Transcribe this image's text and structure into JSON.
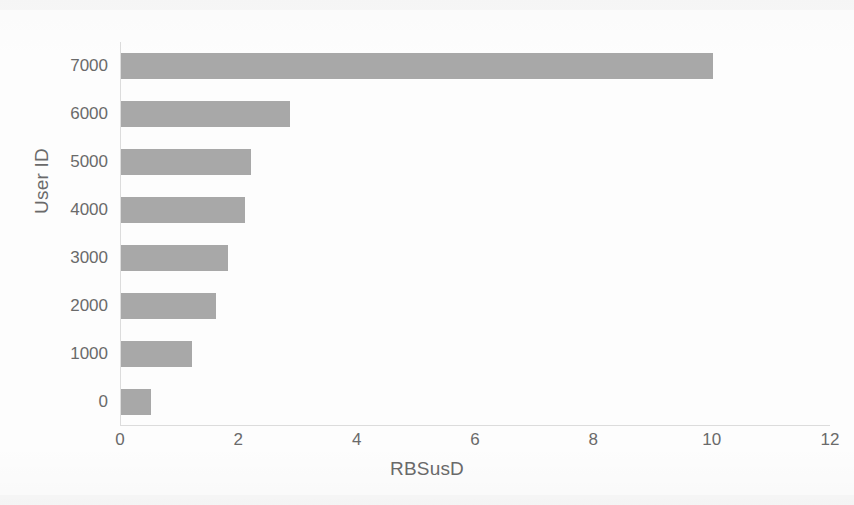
{
  "chart_data": {
    "type": "bar",
    "orientation": "horizontal",
    "title": "",
    "xlabel": "RBSusD",
    "ylabel": "User ID",
    "categories": [
      "7000",
      "6000",
      "5000",
      "4000",
      "3000",
      "2000",
      "1000",
      "0"
    ],
    "values": [
      10.0,
      2.85,
      2.2,
      2.1,
      1.8,
      1.6,
      1.2,
      0.5
    ],
    "xlim": [
      0,
      12
    ],
    "xticks": [
      "0",
      "2",
      "4",
      "6",
      "8",
      "10",
      "12"
    ],
    "xtick_values": [
      0,
      2,
      4,
      6,
      8,
      10,
      12
    ],
    "yticks": [
      "7000",
      "6000",
      "5000",
      "4000",
      "3000",
      "2000",
      "1000",
      "0"
    ],
    "grid": false,
    "legend": false,
    "bar_color": "#a8a8a8",
    "axis_color": "#dcdcdc",
    "text_color": "#6a6a6a",
    "background": "#fdfdfd"
  }
}
